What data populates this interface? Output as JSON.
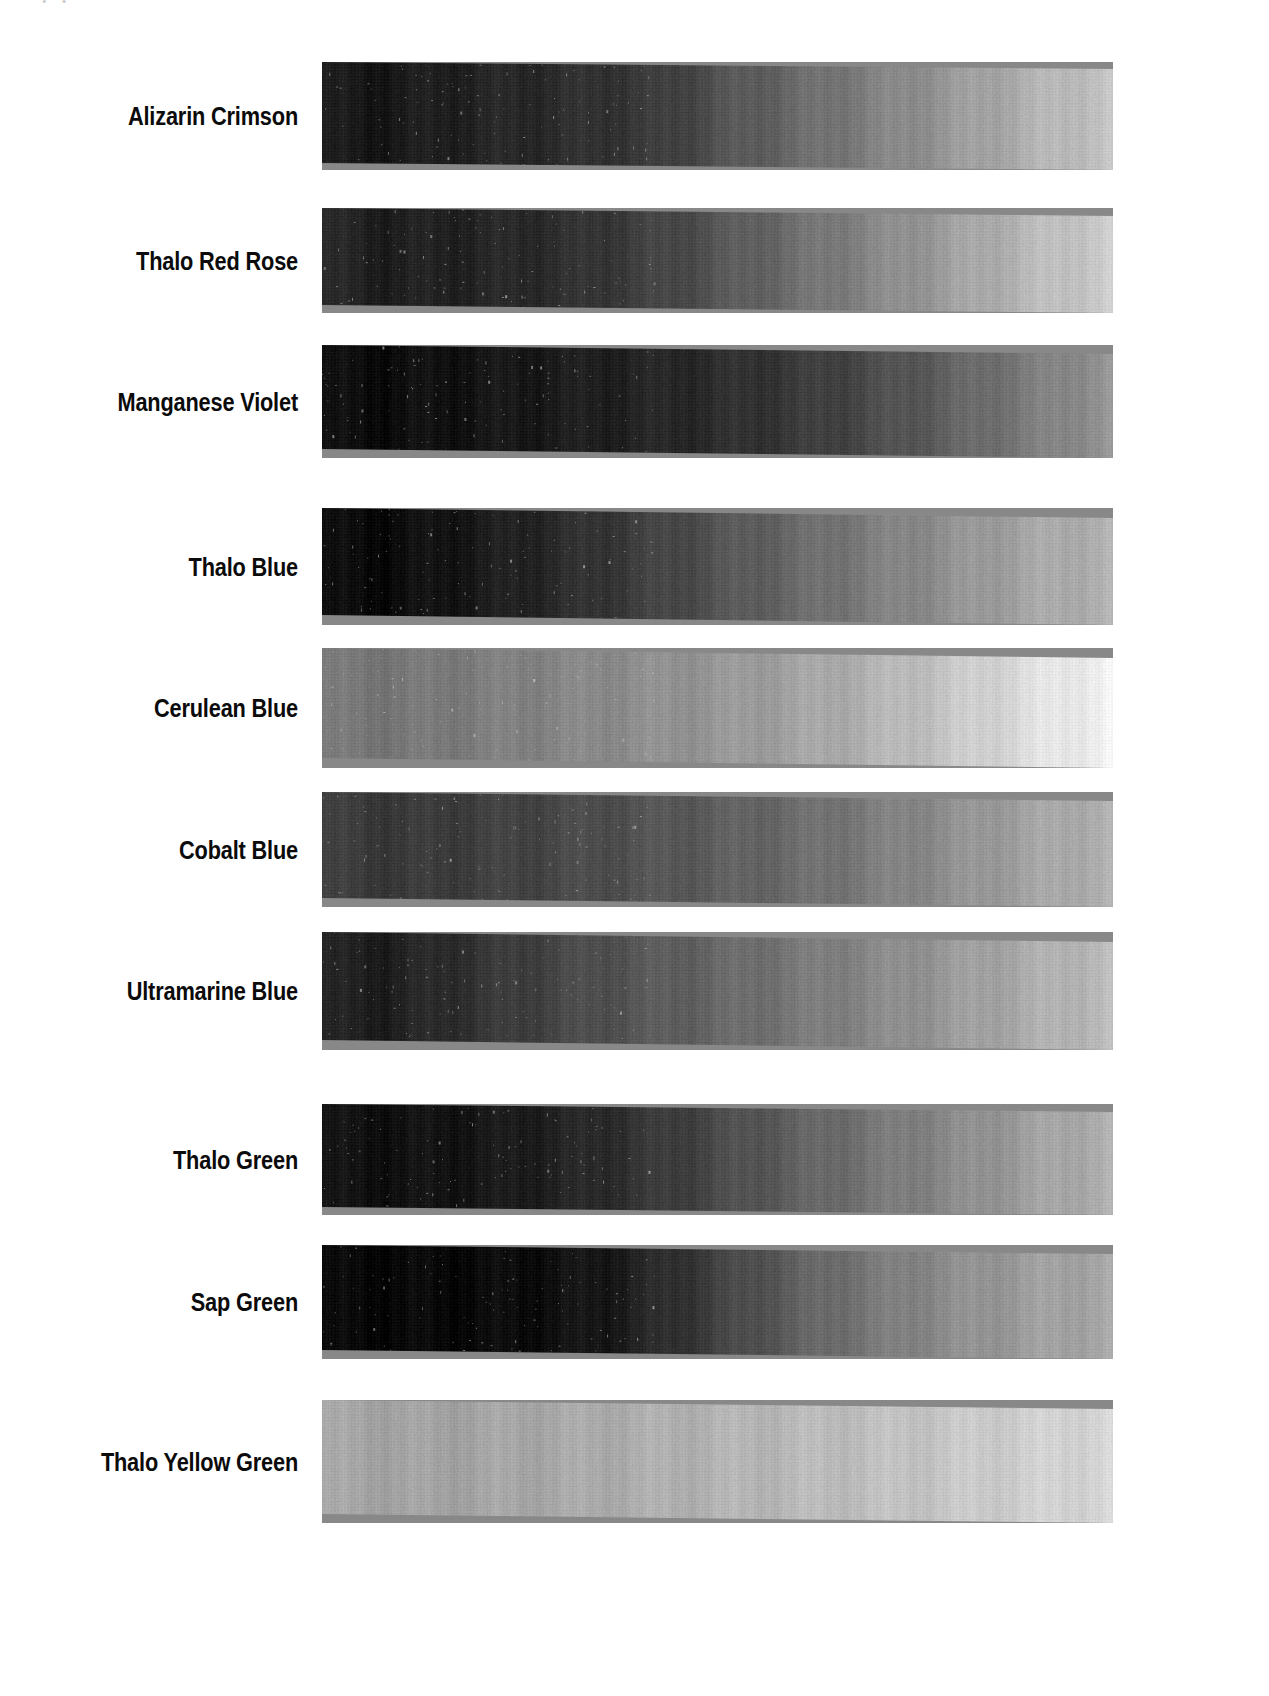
{
  "page": {
    "background": "#ffffff",
    "artifact_text": "• •",
    "label_color": "#0b0b0b",
    "swatch_left": 322,
    "swatch_width": 791
  },
  "chart_data": {
    "type": "bar",
    "subtitle": "Grayscale value gradients of oil pigments, dark (mass tone) to light (tint)",
    "xlabel": "",
    "ylabel": "",
    "orientation": "horizontal",
    "grid": false,
    "legend": null,
    "categories": [
      "Alizarin Crimson",
      "Thalo Red Rose",
      "Manganese Violet",
      "Thalo Blue",
      "Cerulean Blue",
      "Cobalt Blue",
      "Ultramarine Blue",
      "Thalo Green",
      "Sap Green",
      "Thalo Yellow Green"
    ],
    "series": [
      {
        "name": "Darkest value (left end, 0-255)",
        "values": [
          28,
          30,
          12,
          10,
          118,
          56,
          30,
          16,
          8,
          162
        ]
      },
      {
        "name": "Lightest value (right end, 0-255)",
        "values": [
          196,
          205,
          150,
          178,
          242,
          176,
          188,
          176,
          168,
          214
        ]
      }
    ],
    "rows": [
      {
        "label": "Alizarin Crimson",
        "top": 62,
        "height": 101,
        "skew_px": 7,
        "stops": [
          {
            "pos": 0,
            "value": 28
          },
          {
            "pos": 6,
            "value": 22
          },
          {
            "pos": 18,
            "value": 34
          },
          {
            "pos": 30,
            "value": 44
          },
          {
            "pos": 42,
            "value": 58
          },
          {
            "pos": 52,
            "value": 86
          },
          {
            "pos": 62,
            "value": 110
          },
          {
            "pos": 72,
            "value": 134
          },
          {
            "pos": 82,
            "value": 158
          },
          {
            "pos": 92,
            "value": 182
          },
          {
            "pos": 100,
            "value": 196
          }
        ]
      },
      {
        "label": "Thalo Red Rose",
        "top": 208,
        "height": 97,
        "skew_px": 8,
        "stops": [
          {
            "pos": 0,
            "value": 40
          },
          {
            "pos": 8,
            "value": 30
          },
          {
            "pos": 20,
            "value": 36
          },
          {
            "pos": 32,
            "value": 48
          },
          {
            "pos": 44,
            "value": 70
          },
          {
            "pos": 56,
            "value": 100
          },
          {
            "pos": 68,
            "value": 130
          },
          {
            "pos": 80,
            "value": 160
          },
          {
            "pos": 90,
            "value": 185
          },
          {
            "pos": 100,
            "value": 205
          }
        ]
      },
      {
        "label": "Manganese Violet",
        "top": 345,
        "height": 104,
        "skew_px": 9,
        "stops": [
          {
            "pos": 0,
            "value": 14
          },
          {
            "pos": 8,
            "value": 12
          },
          {
            "pos": 22,
            "value": 22
          },
          {
            "pos": 36,
            "value": 32
          },
          {
            "pos": 50,
            "value": 44
          },
          {
            "pos": 62,
            "value": 60
          },
          {
            "pos": 72,
            "value": 80
          },
          {
            "pos": 82,
            "value": 104
          },
          {
            "pos": 92,
            "value": 130
          },
          {
            "pos": 100,
            "value": 150
          }
        ]
      },
      {
        "label": "Thalo Blue",
        "top": 508,
        "height": 107,
        "skew_px": 10,
        "stops": [
          {
            "pos": 0,
            "value": 12
          },
          {
            "pos": 8,
            "value": 10
          },
          {
            "pos": 20,
            "value": 26
          },
          {
            "pos": 32,
            "value": 46
          },
          {
            "pos": 44,
            "value": 70
          },
          {
            "pos": 56,
            "value": 96
          },
          {
            "pos": 68,
            "value": 122
          },
          {
            "pos": 80,
            "value": 146
          },
          {
            "pos": 90,
            "value": 166
          },
          {
            "pos": 100,
            "value": 178
          }
        ]
      },
      {
        "label": "Cerulean Blue",
        "top": 648,
        "height": 110,
        "skew_px": 10,
        "stops": [
          {
            "pos": 0,
            "value": 120
          },
          {
            "pos": 10,
            "value": 118
          },
          {
            "pos": 24,
            "value": 128
          },
          {
            "pos": 38,
            "value": 140
          },
          {
            "pos": 52,
            "value": 152
          },
          {
            "pos": 64,
            "value": 168
          },
          {
            "pos": 74,
            "value": 186
          },
          {
            "pos": 84,
            "value": 208
          },
          {
            "pos": 92,
            "value": 228
          },
          {
            "pos": 100,
            "value": 242
          }
        ]
      },
      {
        "label": "Cobalt Blue",
        "top": 792,
        "height": 106,
        "skew_px": 9,
        "stops": [
          {
            "pos": 0,
            "value": 62
          },
          {
            "pos": 10,
            "value": 56
          },
          {
            "pos": 24,
            "value": 66
          },
          {
            "pos": 38,
            "value": 80
          },
          {
            "pos": 52,
            "value": 96
          },
          {
            "pos": 64,
            "value": 114
          },
          {
            "pos": 76,
            "value": 136
          },
          {
            "pos": 86,
            "value": 156
          },
          {
            "pos": 94,
            "value": 170
          },
          {
            "pos": 100,
            "value": 176
          }
        ]
      },
      {
        "label": "Ultramarine Blue",
        "top": 932,
        "height": 108,
        "skew_px": 10,
        "stops": [
          {
            "pos": 0,
            "value": 34
          },
          {
            "pos": 8,
            "value": 30
          },
          {
            "pos": 20,
            "value": 52
          },
          {
            "pos": 32,
            "value": 74
          },
          {
            "pos": 46,
            "value": 96
          },
          {
            "pos": 58,
            "value": 116
          },
          {
            "pos": 70,
            "value": 136
          },
          {
            "pos": 82,
            "value": 158
          },
          {
            "pos": 92,
            "value": 176
          },
          {
            "pos": 100,
            "value": 188
          }
        ]
      },
      {
        "label": "Thalo Green",
        "top": 1104,
        "height": 103,
        "skew_px": 8,
        "stops": [
          {
            "pos": 0,
            "value": 18
          },
          {
            "pos": 10,
            "value": 16
          },
          {
            "pos": 22,
            "value": 24
          },
          {
            "pos": 34,
            "value": 40
          },
          {
            "pos": 46,
            "value": 64
          },
          {
            "pos": 58,
            "value": 92
          },
          {
            "pos": 70,
            "value": 118
          },
          {
            "pos": 82,
            "value": 142
          },
          {
            "pos": 92,
            "value": 164
          },
          {
            "pos": 100,
            "value": 176
          }
        ]
      },
      {
        "label": "Sap Green",
        "top": 1245,
        "height": 105,
        "skew_px": 9,
        "stops": [
          {
            "pos": 0,
            "value": 8
          },
          {
            "pos": 14,
            "value": 8
          },
          {
            "pos": 26,
            "value": 12
          },
          {
            "pos": 36,
            "value": 24
          },
          {
            "pos": 46,
            "value": 52
          },
          {
            "pos": 56,
            "value": 84
          },
          {
            "pos": 66,
            "value": 112
          },
          {
            "pos": 78,
            "value": 138
          },
          {
            "pos": 90,
            "value": 158
          },
          {
            "pos": 100,
            "value": 168
          }
        ]
      },
      {
        "label": "Thalo Yellow Green",
        "top": 1400,
        "height": 114,
        "skew_px": 9,
        "stops": [
          {
            "pos": 0,
            "value": 166
          },
          {
            "pos": 14,
            "value": 162
          },
          {
            "pos": 30,
            "value": 168
          },
          {
            "pos": 46,
            "value": 176
          },
          {
            "pos": 60,
            "value": 184
          },
          {
            "pos": 72,
            "value": 192
          },
          {
            "pos": 84,
            "value": 202
          },
          {
            "pos": 94,
            "value": 210
          },
          {
            "pos": 100,
            "value": 214
          }
        ]
      }
    ]
  }
}
